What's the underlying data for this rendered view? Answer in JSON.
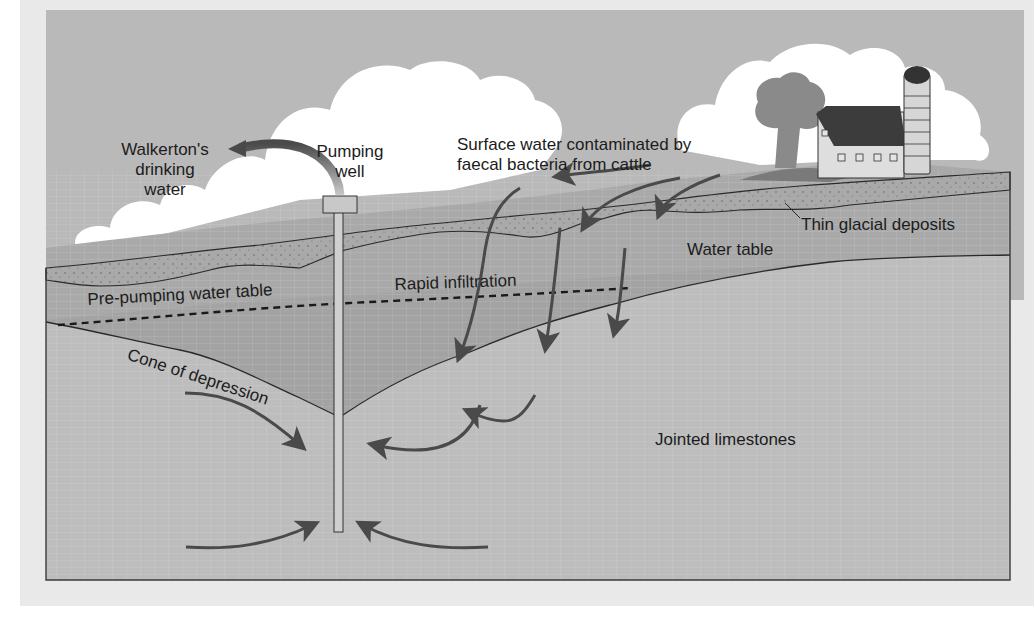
{
  "diagram": {
    "labels": {
      "walkerton": [
        "Walkerton's",
        "drinking",
        "water"
      ],
      "pumping_well": [
        "Pumping",
        "well"
      ],
      "surface_water": [
        "Surface water contaminated by",
        "faecal bacteria from cattle"
      ],
      "thin_glacial": "Thin glacial deposits",
      "water_table": "Water table",
      "pre_pumping": "Pre-pumping water table",
      "rapid_infiltration": "Rapid infiltration",
      "cone_of_depression": "Cone of depression",
      "jointed_limestones": "Jointed limestones"
    },
    "colors": {
      "page": "#e9e9e9",
      "sky": "#b9b9b9",
      "cloud": "#ffffff",
      "glacial": "#a9a9a9",
      "saturated_dark": "#a0a0a0",
      "limestone": "#bdbdbd",
      "line": "#2a2a2a",
      "arrow": "#4a4a4a"
    }
  }
}
